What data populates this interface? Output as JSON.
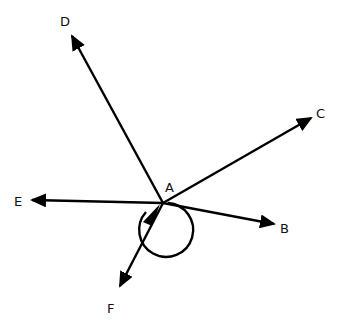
{
  "diagram": {
    "type": "angle-rays",
    "vertex": {
      "label": "A",
      "x": 163,
      "y": 203,
      "label_x": 165,
      "label_y": 192
    },
    "rays": [
      {
        "id": "ray-AD",
        "label": "D",
        "tip_x": 72,
        "tip_y": 36,
        "label_x": 60,
        "label_y": 26
      },
      {
        "id": "ray-AC",
        "label": "C",
        "tip_x": 311,
        "tip_y": 118,
        "label_x": 316,
        "label_y": 118
      },
      {
        "id": "ray-AE",
        "label": "E",
        "tip_x": 32,
        "tip_y": 200,
        "label_x": 14,
        "label_y": 206
      },
      {
        "id": "ray-AB",
        "label": "B",
        "tip_x": 274,
        "tip_y": 224,
        "label_x": 280,
        "label_y": 233
      },
      {
        "id": "ray-AF",
        "label": "F",
        "tip_x": 120,
        "tip_y": 286,
        "label_x": 107,
        "label_y": 313
      }
    ],
    "reflex_arc": {
      "marker": "circular-arrow",
      "center_x": 168,
      "center_y": 230,
      "radius": 27
    },
    "colors": {
      "stroke": "#000000",
      "text": "#111111",
      "background": "#ffffff"
    }
  }
}
